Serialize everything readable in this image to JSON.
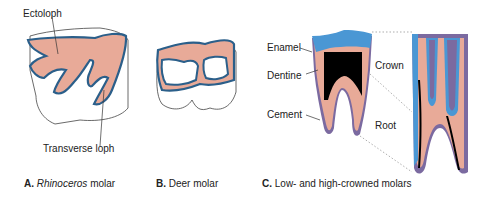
{
  "colors": {
    "enamel": "#4a97d4",
    "enamel_outline": "#2b5f8a",
    "dentine": "#e8aa98",
    "pulp": "#000000",
    "cement": "#7b6aa0",
    "tooth_body": "#ffffff"
  },
  "panel_a": {
    "labels": {
      "ectoloph": "Ectoloph",
      "transverse_loph": "Transverse loph"
    },
    "caption": {
      "letter": "A.",
      "species": "Rhinoceros",
      "rest": " molar"
    }
  },
  "panel_b": {
    "caption": {
      "letter": "B.",
      "text": " Deer molar"
    }
  },
  "panel_c": {
    "labels": {
      "enamel": "Enamel",
      "dentine": "Dentine",
      "cement": "Cement",
      "crown": "Crown",
      "root": "Root"
    },
    "caption": {
      "letter": "C.",
      "text": " Low- and high-crowned molars"
    }
  }
}
